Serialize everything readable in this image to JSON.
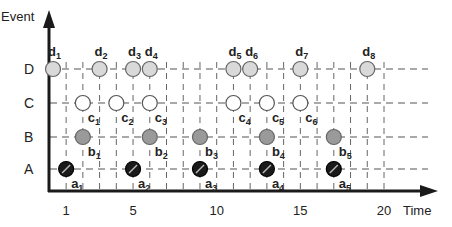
{
  "diagram": {
    "y_axis_label": "Event",
    "x_axis_label": "Time",
    "rows": [
      {
        "key": "D",
        "label": "D",
        "fill": "#d9d9d9",
        "style": "light-gray"
      },
      {
        "key": "C",
        "label": "C",
        "fill": "#ffffff",
        "style": "white"
      },
      {
        "key": "B",
        "label": "B",
        "fill": "#9a9a9a",
        "style": "gray"
      },
      {
        "key": "A",
        "label": "A",
        "fill": "#1a1a1a",
        "style": "black-slashed"
      }
    ],
    "x_ticks": [
      {
        "value": 1,
        "label": "1"
      },
      {
        "value": 5,
        "label": "5"
      },
      {
        "value": 10,
        "label": "10"
      },
      {
        "value": 15,
        "label": "15"
      },
      {
        "value": 20,
        "label": "20"
      }
    ],
    "x_range": [
      0,
      21
    ],
    "events": {
      "D": [
        {
          "name": "d",
          "sub": "1",
          "t": 0.2
        },
        {
          "name": "d",
          "sub": "2",
          "t": 3
        },
        {
          "name": "d",
          "sub": "3",
          "t": 5
        },
        {
          "name": "d",
          "sub": "4",
          "t": 6
        },
        {
          "name": "d",
          "sub": "5",
          "t": 11
        },
        {
          "name": "d",
          "sub": "6",
          "t": 12
        },
        {
          "name": "d",
          "sub": "7",
          "t": 15
        },
        {
          "name": "d",
          "sub": "8",
          "t": 19
        }
      ],
      "C": [
        {
          "name": "c",
          "sub": "1",
          "t": 2
        },
        {
          "name": "c",
          "sub": "2",
          "t": 4
        },
        {
          "name": "c",
          "sub": "3",
          "t": 6
        },
        {
          "name": "c",
          "sub": "4",
          "t": 11
        },
        {
          "name": "c",
          "sub": "5",
          "t": 13
        },
        {
          "name": "c",
          "sub": "6",
          "t": 15
        }
      ],
      "B": [
        {
          "name": "b",
          "sub": "1",
          "t": 2
        },
        {
          "name": "b",
          "sub": "2",
          "t": 6
        },
        {
          "name": "b",
          "sub": "3",
          "t": 9
        },
        {
          "name": "b",
          "sub": "4",
          "t": 13
        },
        {
          "name": "b",
          "sub": "5",
          "t": 17
        }
      ],
      "A": [
        {
          "name": "a",
          "sub": "1",
          "t": 1
        },
        {
          "name": "a",
          "sub": "2",
          "t": 5
        },
        {
          "name": "a",
          "sub": "3",
          "t": 9
        },
        {
          "name": "a",
          "sub": "4",
          "t": 13
        },
        {
          "name": "a",
          "sub": "5",
          "t": 17
        }
      ]
    }
  }
}
